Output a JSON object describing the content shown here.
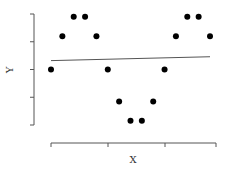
{
  "chart_data": {
    "type": "scatter",
    "title": "",
    "xlabel": "X",
    "ylabel": "Y",
    "xlim": [
      0,
      14.5
    ],
    "ylim": [
      -2,
      2
    ],
    "x_ticks": [
      0,
      5,
      10,
      14.5
    ],
    "y_ticks": [
      -2,
      -1,
      0,
      1,
      2
    ],
    "tick_labels_shown": false,
    "grid": false,
    "legend": "none",
    "series": [
      {
        "name": "points",
        "x": [
          0,
          1,
          2,
          3,
          4,
          5,
          6,
          7,
          8,
          9,
          10,
          11,
          12,
          13,
          14
        ],
        "y": [
          0,
          1.2,
          1.9,
          1.9,
          1.2,
          0,
          -1.15,
          -1.85,
          -1.85,
          -1.15,
          0,
          1.2,
          1.9,
          1.9,
          1.2
        ]
      }
    ],
    "fit_line": {
      "x": [
        0,
        14
      ],
      "y": [
        0.32,
        0.46
      ]
    }
  }
}
